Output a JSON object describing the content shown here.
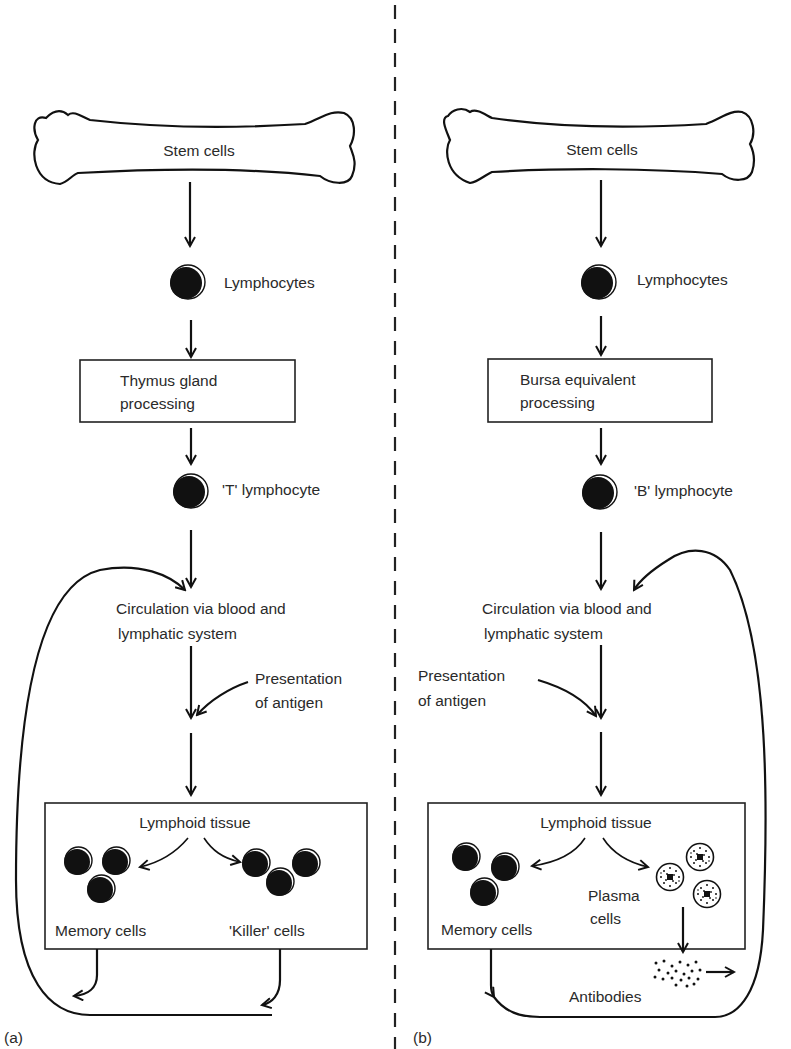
{
  "diagram": {
    "panels": {
      "a": {
        "label": "(a)",
        "stem": "Stem cells",
        "lymphocytes": "Lymphocytes",
        "processing_line1": "Thymus gland",
        "processing_line2": "processing",
        "lymphocyte_type": "'T' lymphocyte",
        "circulation_line1": "Circulation via blood and",
        "circulation_line2": "lymphatic system",
        "antigen_line1": "Presentation",
        "antigen_line2": "of antigen",
        "tissue": "Lymphoid tissue",
        "memory": "Memory cells",
        "killer": "'Killer' cells"
      },
      "b": {
        "label": "(b)",
        "stem": "Stem cells",
        "lymphocytes": "Lymphocytes",
        "processing_line1": "Bursa equivalent",
        "processing_line2": "processing",
        "lymphocyte_type": "'B' lymphocyte",
        "circulation_line1": "Circulation via blood and",
        "circulation_line2": "lymphatic system",
        "antigen_line1": "Presentation",
        "antigen_line2": "of antigen",
        "tissue": "Lymphoid tissue",
        "memory": "Memory cells",
        "plasma_line1": "Plasma",
        "plasma_line2": "cells",
        "antibodies": "Antibodies"
      }
    }
  }
}
